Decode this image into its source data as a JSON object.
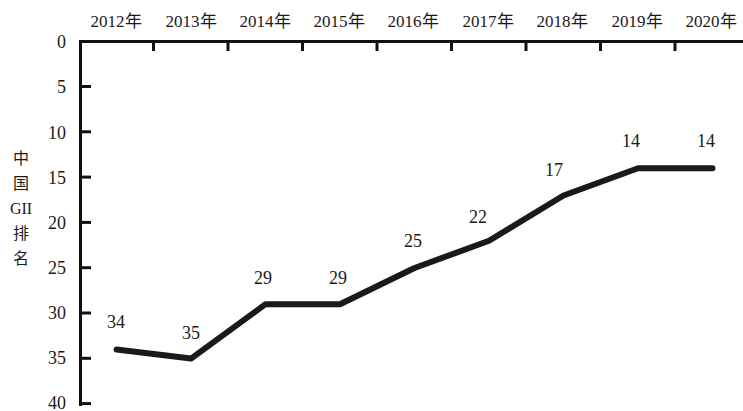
{
  "chart_data": {
    "type": "line",
    "title": "",
    "subtitle": "",
    "xlabel": "",
    "ylabel": "中国GII排名",
    "ylabel_chars": [
      "中",
      "国",
      "GII",
      "排",
      "名"
    ],
    "categories": [
      "2012年",
      "2013年",
      "2014年",
      "2015年",
      "2016年",
      "2017年",
      "2018年",
      "2019年",
      "2020年"
    ],
    "values": [
      34,
      35,
      29,
      29,
      25,
      22,
      17,
      14,
      14
    ],
    "point_labels": [
      "34",
      "35",
      "29",
      "29",
      "25",
      "22",
      "17",
      "14",
      "14"
    ],
    "ylim": [
      0,
      40
    ],
    "y_inverted": true,
    "y_ticks": [
      0,
      5,
      10,
      15,
      20,
      25,
      30,
      35,
      40
    ],
    "y_tick_labels": [
      "0",
      "5",
      "10",
      "15",
      "20",
      "25",
      "30",
      "35",
      "40"
    ],
    "grid": false,
    "legend": "none",
    "x_axis_position": "top",
    "line_color": "#1a1a1a",
    "line_width": 6,
    "axis_color": "#111111",
    "background_color": "#ffffff"
  },
  "axis": {
    "x_labels": [
      "2012年",
      "2013年",
      "2014年",
      "2015年",
      "2016年",
      "2017年",
      "2018年",
      "2019年",
      "2020年"
    ],
    "y_labels": [
      "0",
      "5",
      "10",
      "15",
      "20",
      "25",
      "30",
      "35",
      "40"
    ]
  }
}
